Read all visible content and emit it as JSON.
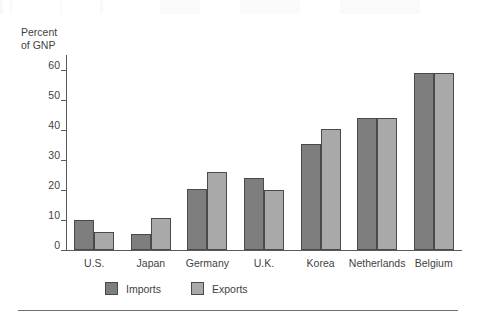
{
  "chart_data": {
    "type": "bar",
    "title": "",
    "xlabel": "",
    "ylabel": "Percent\nof GNP",
    "ylim": [
      0,
      65
    ],
    "yticks": [
      0,
      10,
      20,
      30,
      40,
      50,
      60
    ],
    "grid": false,
    "legend_position": "bottom-left",
    "categories": [
      "U.S.",
      "Japan",
      "Germany",
      "U.K.",
      "Korea",
      "Netherlands",
      "Belgium"
    ],
    "series": [
      {
        "name": "Imports",
        "color": "#7e7e7e",
        "values": [
          10,
          5.5,
          20.5,
          24,
          35.5,
          44,
          59
        ]
      },
      {
        "name": "Exports",
        "color": "#a9a9a9",
        "values": [
          6,
          10.8,
          26,
          20,
          40.5,
          44,
          59
        ]
      }
    ]
  }
}
